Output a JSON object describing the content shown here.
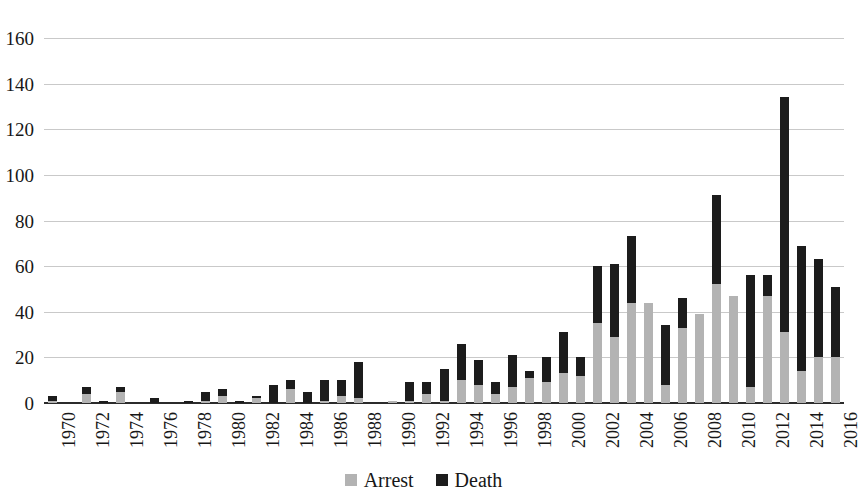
{
  "chart_data": {
    "type": "bar",
    "stacked": true,
    "title": "",
    "subtitle": "",
    "xlabel": "",
    "ylabel": "",
    "ylim": [
      0,
      160
    ],
    "ytick_step": 20,
    "yticks": [
      0,
      20,
      40,
      60,
      80,
      100,
      120,
      140,
      160
    ],
    "ytick_labels": [
      "0",
      "20",
      "40",
      "60",
      "80",
      "100",
      "120",
      "140",
      "160"
    ],
    "grid": true,
    "grid_axis": "y",
    "legend_position": "bottom-center",
    "xtick_rotation": -90,
    "xtick_label_interval": 2,
    "categories": [
      "1970",
      "1971",
      "1972",
      "1973",
      "1974",
      "1975",
      "1976",
      "1977",
      "1978",
      "1979",
      "1980",
      "1981",
      "1982",
      "1983",
      "1984",
      "1985",
      "1986",
      "1987",
      "1988",
      "1989",
      "1990",
      "1991",
      "1992",
      "1993",
      "1994",
      "1995",
      "1996",
      "1997",
      "1998",
      "1999",
      "2000",
      "2001",
      "2002",
      "2003",
      "2004",
      "2005",
      "2006",
      "2007",
      "2008",
      "2009",
      "2010",
      "2011",
      "2012",
      "2013",
      "2014",
      "2015",
      "2016"
    ],
    "xtick_labels": [
      "1970",
      "",
      "1972",
      "",
      "1974",
      "",
      "1976",
      "",
      "1978",
      "",
      "1980",
      "",
      "1982",
      "",
      "1984",
      "",
      "1986",
      "",
      "1988",
      "",
      "1990",
      "",
      "1992",
      "",
      "1994",
      "",
      "1996",
      "",
      "1998",
      "",
      "2000",
      "",
      "2002",
      "",
      "2004",
      "",
      "2006",
      "",
      "2008",
      "",
      "2010",
      "",
      "2012",
      "",
      "2014",
      "",
      "2016"
    ],
    "series": [
      {
        "name": "Arrest",
        "color": "#b3b3b3",
        "values": [
          1,
          0,
          4,
          0,
          5,
          0,
          0,
          0,
          0,
          1,
          3,
          0,
          2,
          0,
          6,
          0,
          1,
          3,
          2,
          0,
          1,
          1,
          4,
          1,
          10,
          8,
          4,
          7,
          11,
          9,
          13,
          12,
          35,
          29,
          44,
          44,
          8,
          33,
          39,
          52,
          47,
          7,
          47,
          31,
          14,
          20,
          20
        ]
      },
      {
        "name": "Death",
        "color": "#1c1c1c",
        "values": [
          2,
          0,
          3,
          1,
          2,
          0,
          2,
          0,
          1,
          4,
          3,
          1,
          1,
          8,
          4,
          5,
          9,
          7,
          16,
          0,
          0,
          8,
          5,
          14,
          16,
          11,
          5,
          14,
          3,
          11,
          18,
          8,
          25,
          32,
          29,
          0,
          26,
          13,
          0,
          39,
          0,
          49,
          9,
          103,
          55,
          43,
          31
        ]
      }
    ],
    "totals": [
      3,
      0,
      7,
      1,
      7,
      0,
      2,
      0,
      1,
      5,
      6,
      1,
      3,
      8,
      10,
      5,
      10,
      10,
      18,
      0,
      1,
      9,
      9,
      15,
      26,
      19,
      9,
      21,
      14,
      20,
      31,
      20,
      60,
      61,
      73,
      44,
      34,
      46,
      39,
      91,
      47,
      56,
      56,
      134,
      86,
      63,
      51
    ]
  },
  "legend": {
    "items": [
      {
        "label": "Arrest",
        "swatch": "arrest-swatch-icon"
      },
      {
        "label": "Death",
        "swatch": "death-swatch-icon"
      }
    ]
  }
}
